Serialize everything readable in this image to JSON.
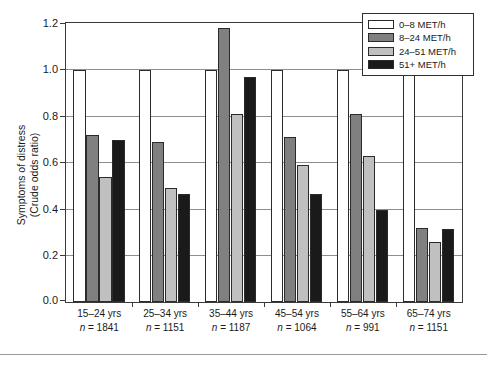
{
  "chart_data": {
    "type": "bar",
    "title": "",
    "xlabel": "",
    "ylabel_line1": "Symptoms of distress",
    "ylabel_line2": "(Crude odds ratio)",
    "ylim": [
      0,
      1.2
    ],
    "yticks": [
      "0.0",
      "0.2",
      "0.4",
      "0.6",
      "0.8",
      "1.0",
      "1.2"
    ],
    "ytick_values": [
      0.0,
      0.2,
      0.4,
      0.6,
      0.8,
      1.0,
      1.2
    ],
    "grid": "horizontal",
    "legend_position": "top-right",
    "categories": [
      "15–24 yrs",
      "25–34 yrs",
      "35–44 yrs",
      "45–54 yrs",
      "55–64 yrs",
      "65–74 yrs"
    ],
    "category_counts": [
      "n = 1841",
      "n = 1151",
      "n = 1187",
      "n = 1064",
      "n = 991",
      "n = 1151"
    ],
    "series": [
      {
        "name": "0–8 MET/h",
        "color": "#ffffff",
        "values": [
          1.0,
          1.0,
          1.0,
          1.0,
          1.0,
          1.0
        ]
      },
      {
        "name": "8–24 MET/h",
        "color": "#808080",
        "values": [
          0.72,
          0.69,
          1.18,
          0.71,
          0.81,
          0.32
        ]
      },
      {
        "name": "24–51 MET/h",
        "color": "#c0c0c0",
        "values": [
          0.54,
          0.49,
          0.81,
          0.59,
          0.63,
          0.26
        ]
      },
      {
        "name": "51+ MET/h",
        "color": "#1a1a1a",
        "values": [
          0.7,
          0.465,
          0.97,
          0.465,
          0.395,
          0.315
        ]
      }
    ]
  },
  "caption_fragment": "",
  "colors": {
    "axis": "#3a3a3a",
    "grid": "#8e8e8e",
    "bar_outline": "#2b2b2b",
    "background": "#ffffff"
  }
}
